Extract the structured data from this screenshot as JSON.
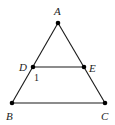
{
  "diagram": {
    "points": [
      {
        "id": "A",
        "label": "A"
      },
      {
        "id": "B",
        "label": "B"
      },
      {
        "id": "C",
        "label": "C"
      },
      {
        "id": "D",
        "label": "D"
      },
      {
        "id": "E",
        "label": "E"
      }
    ],
    "segments": [
      {
        "from": "A",
        "to": "B"
      },
      {
        "from": "A",
        "to": "C"
      },
      {
        "from": "B",
        "to": "C"
      },
      {
        "from": "D",
        "to": "E"
      }
    ],
    "angle_marks": [
      {
        "at": "D",
        "label": "1"
      }
    ],
    "line_color": "#1a1a1a",
    "point_color": "#000000"
  }
}
